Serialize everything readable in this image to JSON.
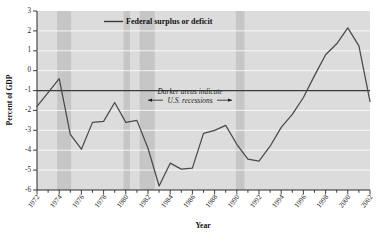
{
  "chart_data": {
    "type": "line",
    "title": "",
    "xlabel": "Year",
    "ylabel": "Percent of GDP",
    "xlim": [
      1972,
      2002
    ],
    "ylim": [
      -6,
      3
    ],
    "grid": true,
    "legend_position": "top-center",
    "series": [
      {
        "name": "Federal surplus or deficit",
        "x": [
          1972,
          1973,
          1974,
          1975,
          1976,
          1977,
          1978,
          1979,
          1980,
          1981,
          1982,
          1983,
          1984,
          1985,
          1986,
          1987,
          1988,
          1989,
          1990,
          1991,
          1992,
          1993,
          1994,
          1995,
          1996,
          1997,
          1998,
          1999,
          2000,
          2001,
          2002
        ],
        "values": [
          -1.8,
          -1.1,
          -0.4,
          -3.2,
          -3.95,
          -2.6,
          -2.55,
          -1.6,
          -2.6,
          -2.5,
          -3.9,
          -5.8,
          -4.65,
          -4.95,
          -4.9,
          -3.15,
          -3.0,
          -2.75,
          -3.7,
          -4.45,
          -4.55,
          -3.8,
          -2.85,
          -2.2,
          -1.35,
          -0.25,
          0.8,
          1.35,
          2.15,
          1.25,
          -1.55
        ]
      }
    ],
    "yticks": [
      3,
      2,
      1,
      0,
      -1,
      -2,
      -3,
      -4,
      -5,
      -6
    ],
    "xticks": [
      1972,
      1974,
      1976,
      1978,
      1980,
      1982,
      1984,
      1986,
      1988,
      1990,
      1992,
      1994,
      1996,
      1998,
      2000,
      2002
    ],
    "xtick_labels": [
      "1972",
      "1974",
      "1976",
      "1978",
      "1980",
      "1982",
      "1984",
      "1986",
      "1988",
      "1990",
      "1992",
      "1994",
      "1996",
      "1998",
      "2000",
      "2002"
    ],
    "ytick_labels": [
      "3",
      "2",
      "1",
      "0",
      "-1",
      "-2",
      "-3",
      "-4",
      "-5",
      "-6"
    ],
    "shaded_regions": [
      {
        "label": "recession",
        "start": 1973.9,
        "end": 1975.2
      },
      {
        "label": "recession",
        "start": 1980.0,
        "end": 1980.6
      },
      {
        "label": "recession",
        "start": 1981.5,
        "end": 1982.9
      },
      {
        "label": "recession",
        "start": 1990.5,
        "end": 1991.3
      }
    ],
    "annotations": [
      {
        "text_line_1": "Darker areas indicate",
        "text_line_2": "U.S. recessions",
        "x": 1986.2,
        "y": -1.45
      }
    ],
    "colors": {
      "plot_background": "#dcdcdc",
      "recession_band": "#c6c6c6",
      "gridline": "#ffffff",
      "line": "#4a4a4a",
      "zero_line": "#3a3a3a",
      "axis": "#2b2b2b",
      "text": "#1d1d1d",
      "page_background": "#ffffff"
    }
  },
  "legend": {
    "entries": [
      {
        "label": "Federal surplus or deficit",
        "swatch": "line-swatch"
      }
    ]
  },
  "axes": {
    "y_title": "Percent of GDP",
    "x_title": "Year"
  }
}
